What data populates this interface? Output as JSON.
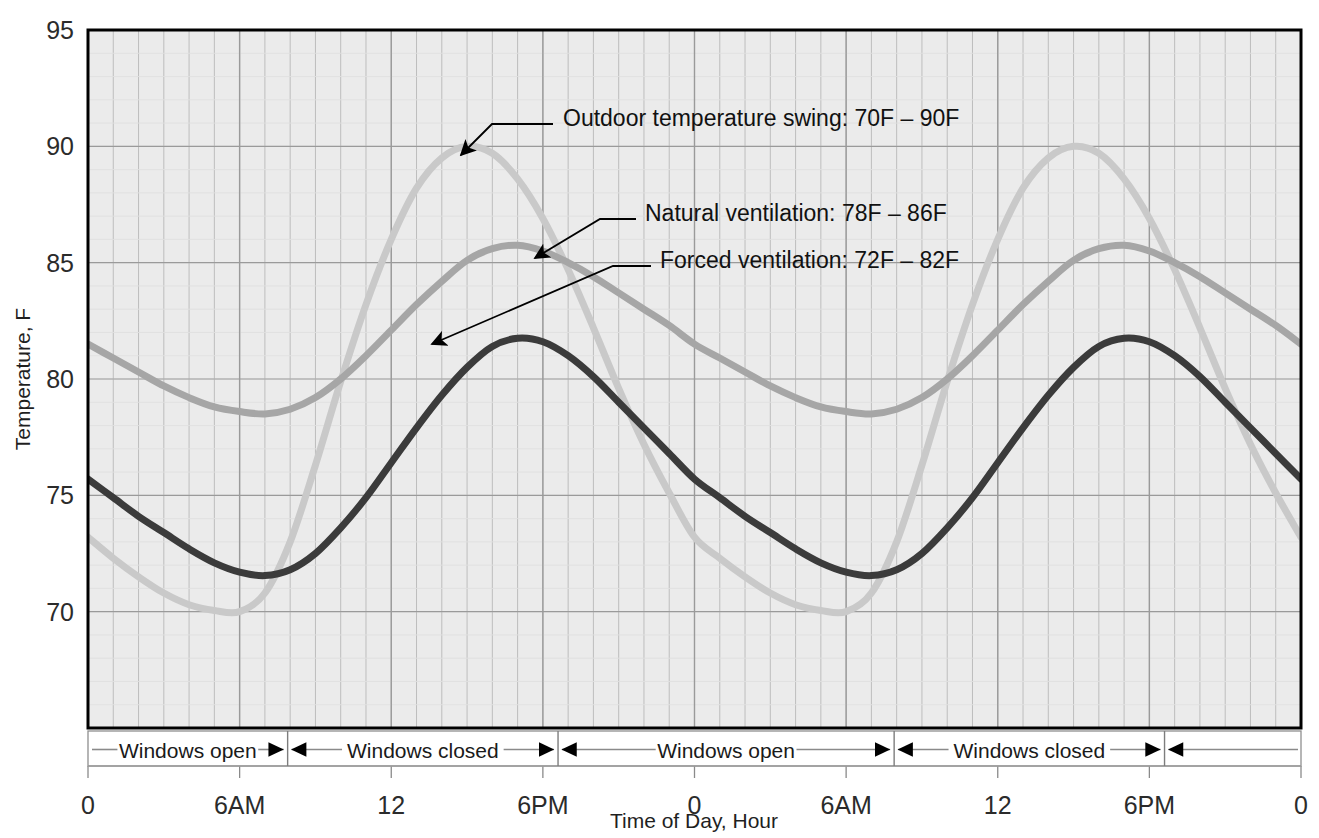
{
  "chart_data": {
    "type": "line",
    "title": "",
    "subtitle": "",
    "xlabel": "Time of Day, Hour",
    "ylabel": "Temperature, F",
    "xlim": [
      0,
      48
    ],
    "ylim": [
      65,
      95
    ],
    "yticks": [
      70,
      75,
      80,
      85,
      90,
      95
    ],
    "ytick_labels": [
      "70",
      "75",
      "80",
      "85",
      "90",
      "95"
    ],
    "xticks": [
      0,
      6,
      12,
      18,
      24,
      30,
      36,
      42,
      48
    ],
    "xtick_labels": [
      "0",
      "6AM",
      "12",
      "6PM",
      "0",
      "6AM",
      "12",
      "6PM",
      "0"
    ],
    "grid": true,
    "grid_minor_x_step_hours": 1,
    "grid_minor_y_step_deg": 1,
    "legend_position": "inline-annotations",
    "x": [
      0,
      1,
      2,
      3,
      4,
      5,
      6,
      7,
      8,
      9,
      10,
      11,
      12,
      13,
      14,
      15,
      16,
      17,
      18,
      19,
      20,
      21,
      22,
      23,
      24,
      25,
      26,
      27,
      28,
      29,
      30,
      31,
      32,
      33,
      34,
      35,
      36,
      37,
      38,
      39,
      40,
      41,
      42,
      43,
      44,
      45,
      46,
      47,
      48
    ],
    "series": [
      {
        "name": "Outdoor temperature swing",
        "label": "Outdoor temperature swing: 70F – 90F",
        "color": "#c9c9c9",
        "min": 70,
        "max": 90,
        "width": 7,
        "values": [
          73.2,
          72.3,
          71.5,
          70.8,
          70.3,
          70.05,
          70.0,
          70.8,
          73.0,
          76.3,
          79.9,
          83.2,
          86.0,
          88.2,
          89.5,
          90.0,
          89.7,
          88.6,
          86.9,
          84.7,
          82.2,
          79.6,
          77.2,
          75.1,
          73.2,
          72.3,
          71.5,
          70.8,
          70.3,
          70.05,
          70.0,
          70.8,
          73.0,
          76.3,
          79.9,
          83.2,
          86.0,
          88.2,
          89.5,
          90.0,
          89.7,
          88.6,
          86.9,
          84.7,
          82.2,
          79.6,
          77.2,
          75.1,
          73.2
        ]
      },
      {
        "name": "Natural ventilation",
        "label": "Natural ventilation: 78F – 86F",
        "color": "#a6a6a6",
        "min": 78,
        "max": 86,
        "width": 7,
        "values": [
          81.5,
          80.9,
          80.3,
          79.7,
          79.2,
          78.8,
          78.6,
          78.5,
          78.7,
          79.2,
          80.0,
          81.0,
          82.1,
          83.2,
          84.2,
          85.1,
          85.6,
          85.75,
          85.5,
          85.0,
          84.4,
          83.7,
          83.0,
          82.3,
          81.5,
          80.9,
          80.3,
          79.7,
          79.2,
          78.8,
          78.6,
          78.5,
          78.7,
          79.2,
          80.0,
          81.0,
          82.1,
          83.2,
          84.2,
          85.1,
          85.6,
          85.75,
          85.5,
          85.0,
          84.4,
          83.7,
          83.0,
          82.3,
          81.5
        ]
      },
      {
        "name": "Forced ventilation",
        "label": "Forced ventilation: 72F – 82F",
        "color": "#3b3b3b",
        "min": 72,
        "max": 82,
        "width": 7,
        "values": [
          75.7,
          74.9,
          74.1,
          73.4,
          72.7,
          72.1,
          71.7,
          71.55,
          71.8,
          72.5,
          73.6,
          74.9,
          76.4,
          77.9,
          79.3,
          80.5,
          81.4,
          81.75,
          81.6,
          81.0,
          80.1,
          79.0,
          77.9,
          76.8,
          75.7,
          74.9,
          74.1,
          73.4,
          72.7,
          72.1,
          71.7,
          71.55,
          71.8,
          72.5,
          73.6,
          74.9,
          76.4,
          77.9,
          79.3,
          80.5,
          81.4,
          81.75,
          81.6,
          81.0,
          80.1,
          79.0,
          77.9,
          76.8,
          75.7
        ]
      }
    ],
    "annotations": [
      {
        "id": "outdoor",
        "text": "Outdoor temperature swing: 70F – 90F",
        "text_x": 563,
        "text_y": 118,
        "arrow_tip_x": 461,
        "arrow_tip_y": 155,
        "elbow_x": 492,
        "elbow_y": 124,
        "line_end_x": 553,
        "line_end_y": 124
      },
      {
        "id": "natural",
        "text": "Natural ventilation: 78F – 86F",
        "text_x": 645,
        "text_y": 213,
        "arrow_tip_x": 535,
        "arrow_tip_y": 258,
        "elbow_x": 600,
        "elbow_y": 219,
        "line_end_x": 636,
        "line_end_y": 219
      },
      {
        "id": "forced",
        "text": "Forced ventilation: 72F – 82F",
        "text_x": 660,
        "text_y": 260,
        "arrow_tip_x": 432,
        "arrow_tip_y": 344,
        "elbow_x": 613,
        "elbow_y": 266,
        "line_end_x": 651,
        "line_end_y": 266
      }
    ],
    "bands": [
      {
        "label": "Windows open",
        "start_hour": 0,
        "end_hour": 7.9
      },
      {
        "label": "Windows closed",
        "start_hour": 7.9,
        "end_hour": 18.6
      },
      {
        "label": "Windows open",
        "start_hour": 18.6,
        "end_hour": 31.9
      },
      {
        "label": "Windows closed",
        "start_hour": 31.9,
        "end_hour": 42.6
      },
      {
        "label": "",
        "start_hour": 42.6,
        "end_hour": 48
      }
    ],
    "colors": {
      "plot_background": "#ebebeb",
      "plot_border": "#000000",
      "gridline_major": "#9a9a9a",
      "gridline_minor": "#bdbdbd",
      "text": "#1a1a1a"
    }
  }
}
